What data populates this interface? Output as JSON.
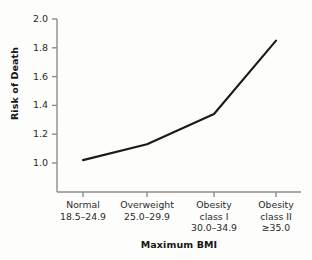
{
  "chart_data": {
    "type": "line",
    "title": "",
    "xlabel": "Maximum BMI",
    "ylabel": "Risk of Death",
    "categories": [
      "Normal 18.5–24.9",
      "Overweight 25.0–29.9",
      "Obesity class I 30.0–34.9",
      "Obesity class II ≥35.0"
    ],
    "category_lines": [
      [
        "Normal",
        "18.5–24.9"
      ],
      [
        "Overweight",
        "25.0–29.9"
      ],
      [
        "Obesity",
        "class I",
        "30.0–34.9"
      ],
      [
        "Obesity",
        "class II",
        "≥35.0"
      ]
    ],
    "values": [
      1.02,
      1.13,
      1.34,
      1.85
    ],
    "ylim": [
      0.9,
      2.0
    ],
    "yticks": [
      "1.0",
      "1.2",
      "1.4",
      "1.6",
      "1.8",
      "2.0"
    ],
    "ytick_values": [
      1.0,
      1.2,
      1.4,
      1.6,
      1.8,
      2.0
    ],
    "grid": false,
    "legend": false,
    "markers": false,
    "line_color": "#1a1a1a",
    "axis_color": "#8c8c8c",
    "background_color": "#fdfdfc"
  }
}
